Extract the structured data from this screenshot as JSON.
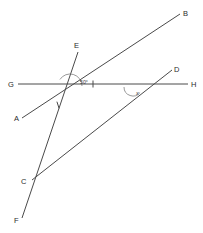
{
  "figure": {
    "type": "geometry-diagram",
    "background_color": "#ffffff",
    "line_color": "#4a4a4a",
    "label_color": "#2b2b2b",
    "width": 203,
    "height": 233
  },
  "points": [
    {
      "id": "B",
      "label": "B",
      "x": 180,
      "y": 14,
      "label_x": 183,
      "label_y": 16
    },
    {
      "id": "E",
      "label": "E",
      "x": 78,
      "y": 52,
      "label_x": 74,
      "label_y": 48
    },
    {
      "id": "D",
      "label": "D",
      "x": 172,
      "y": 70,
      "label_x": 174,
      "label_y": 72
    },
    {
      "id": "G",
      "label": "G",
      "x": 18,
      "y": 84,
      "label_x": 8,
      "label_y": 87
    },
    {
      "id": "H",
      "label": "H",
      "x": 188,
      "y": 84,
      "label_x": 191,
      "label_y": 87
    },
    {
      "id": "A",
      "label": "A",
      "x": 22,
      "y": 118,
      "label_x": 14,
      "label_y": 121
    },
    {
      "id": "C",
      "label": "C",
      "x": 32,
      "y": 180,
      "label_x": 21,
      "label_y": 184
    },
    {
      "id": "F",
      "label": "F",
      "x": 22,
      "y": 218,
      "label_x": 14,
      "label_y": 223
    }
  ],
  "lines": [
    {
      "id": "line-GH",
      "name": "line-g-h",
      "from": "G",
      "to": "H",
      "x1": 18,
      "y1": 84,
      "x2": 188,
      "y2": 84
    },
    {
      "id": "line-AB",
      "name": "line-a-b",
      "from": "A",
      "to": "B",
      "x1": 22,
      "y1": 118,
      "x2": 180,
      "y2": 14
    },
    {
      "id": "line-EF",
      "name": "line-e-f",
      "from": "E",
      "to": "F",
      "x1": 78,
      "y1": 52,
      "x2": 22,
      "y2": 218
    },
    {
      "id": "line-CD",
      "name": "line-c-d",
      "from": "C",
      "to": "D",
      "x1": 32,
      "y1": 180,
      "x2": 172,
      "y2": 70
    }
  ],
  "intersections": [
    {
      "id": "vertex-main",
      "name": "intersection-ab-ef-gh",
      "x": 70,
      "y": 86
    },
    {
      "id": "vertex-cd-gh",
      "name": "intersection-cd-gh",
      "x": 133,
      "y": 87
    },
    {
      "id": "vertex-cd-ef",
      "name": "intersection-cd-ef",
      "x": 47,
      "y": 172
    }
  ],
  "angles": [
    {
      "id": "angle-main",
      "name": "angle-50-degrees",
      "value": "50°",
      "label_x": 80,
      "label_y": 84,
      "arc_radius": 12,
      "vertex_x": 70,
      "vertex_y": 86,
      "start_deg": 0,
      "end_deg": 147
    },
    {
      "id": "angle-x",
      "name": "angle-x",
      "value": "x",
      "label_x": 136,
      "label_y": 95,
      "arc_radius": 9,
      "vertex_x": 133,
      "vertex_y": 87,
      "start_deg": 180,
      "end_deg": 322
    }
  ],
  "tick_marks": [
    {
      "id": "tick-gh",
      "name": "tick-mark-on-gh",
      "x": 93,
      "y": 84,
      "angle_deg": 90,
      "length": 7
    },
    {
      "id": "tick-ef",
      "name": "tick-mark-on-ef",
      "x": 58,
      "y": 105,
      "angle_deg": 72,
      "length": 7
    }
  ]
}
